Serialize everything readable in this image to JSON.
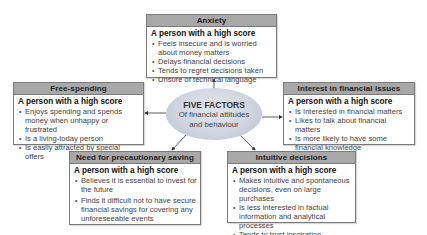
{
  "center": {
    "title": "FIVE FACTORS",
    "subtitle_line1": "Of financial attitudes",
    "subtitle_line2": "and behaviour"
  },
  "factors": [
    {
      "id": "anxiety",
      "title": "Anxiety",
      "subtitle": "A person with a high score",
      "items": [
        "Feels insecure and is worried about money matters",
        "Delays financial decisions",
        "Tends to regret decisions taken",
        "Unsure of technical language"
      ]
    },
    {
      "id": "free-spending",
      "title": "Free-spending",
      "subtitle": "A person with a high score",
      "items": [
        "Enjoys spending and spends money when unhappy or frustrated",
        "Is a living-today person",
        "Is easily attracted by special offers"
      ]
    },
    {
      "id": "interest-in-financial-issues",
      "title": "Interest in financial issues",
      "subtitle": "A person with a high score",
      "items": [
        "Is Interested in financial matters",
        "Likes to talk about financial matters",
        "Is more likely to have some financial knowledge"
      ]
    },
    {
      "id": "need-for-precautionary-saving",
      "title": "Need for precautionary saving",
      "subtitle": "A person with a high score",
      "items": [
        "Believes it is essential to invest for the future",
        "Finds it difficult not to have secure financial savings for covering any unforeseeable events"
      ]
    },
    {
      "id": "intuitive-decisions",
      "title": "Intuitive decisions",
      "subtitle": "A person with a high score",
      "items": [
        "Makes intuitive and spontaneous decisions, even on large purchases",
        "Is less interested in factual information and analytical processes",
        "Tends to trust inspiration"
      ]
    }
  ],
  "colors": {
    "header_band": "#a8a8a8",
    "ellipse": "#cfd5df",
    "border": "#7a7a7a"
  }
}
